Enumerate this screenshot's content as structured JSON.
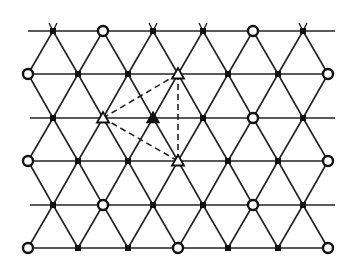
{
  "diagram": {
    "type": "triangular-lattice",
    "colors": {
      "background": "#ffffff",
      "line": "#222222",
      "node": "#111111"
    },
    "rows": [
      {
        "y": 31,
        "xs": [
          53,
          103,
          153,
          203,
          253,
          303
        ],
        "line": [
          28,
          335
        ]
      },
      {
        "y": 74,
        "xs": [
          28,
          78,
          128,
          178,
          228,
          278,
          328
        ],
        "line": [
          28,
          328
        ]
      },
      {
        "y": 118,
        "xs": [
          53,
          103,
          153,
          203,
          253,
          303
        ],
        "line": [
          30,
          335
        ]
      },
      {
        "y": 161,
        "xs": [
          28,
          78,
          128,
          178,
          228,
          278,
          328
        ],
        "line": [
          28,
          328
        ]
      },
      {
        "y": 205,
        "xs": [
          53,
          103,
          153,
          203,
          253,
          303
        ],
        "line": [
          30,
          335
        ]
      },
      {
        "y": 248,
        "xs": [
          28,
          78,
          128,
          178,
          228,
          278,
          328
        ],
        "line": [
          28,
          328
        ]
      }
    ],
    "markers": {
      "open_circles": [
        [
          103,
          31
        ],
        [
          253,
          31
        ],
        [
          28,
          74
        ],
        [
          328,
          74
        ],
        [
          253,
          118
        ],
        [
          28,
          161
        ],
        [
          328,
          161
        ],
        [
          103,
          205
        ],
        [
          253,
          205
        ],
        [
          28,
          248
        ],
        [
          178,
          248
        ],
        [
          328,
          248
        ]
      ],
      "open_triangles": [
        [
          178,
          74
        ],
        [
          103,
          118
        ],
        [
          178,
          161
        ]
      ],
      "filled_triangles": [
        [
          153,
          118
        ]
      ]
    },
    "dashed_lines": [
      [
        [
          103,
          118
        ],
        [
          178,
          74
        ]
      ],
      [
        [
          103,
          118
        ],
        [
          178,
          161
        ]
      ],
      [
        [
          178,
          74
        ],
        [
          178,
          161
        ]
      ]
    ]
  }
}
